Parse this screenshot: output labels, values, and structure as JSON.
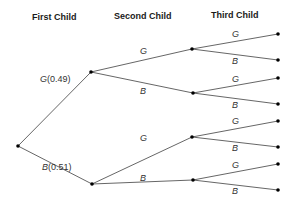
{
  "headers": [
    "First Child",
    "Second Child",
    "Third Child"
  ],
  "root": {
    "x": 18,
    "y": 146
  },
  "level1": [
    {
      "label": "G",
      "prob": "(0.49)",
      "x": 91,
      "y": 72,
      "lx": 40,
      "ly": 82
    },
    {
      "label": "B",
      "prob": "(0.51)",
      "x": 92,
      "y": 184,
      "lx": 42,
      "ly": 170
    }
  ],
  "level2": [
    {
      "parent": 0,
      "label": "G",
      "x": 192,
      "y": 49,
      "lx": 140,
      "ly": 54
    },
    {
      "parent": 0,
      "label": "B",
      "x": 193,
      "y": 93,
      "lx": 140,
      "ly": 94
    },
    {
      "parent": 1,
      "label": "G",
      "x": 192,
      "y": 137,
      "lx": 140,
      "ly": 141
    },
    {
      "parent": 1,
      "label": "B",
      "x": 193,
      "y": 180,
      "lx": 140,
      "ly": 181
    }
  ],
  "leaves": [
    {
      "parent": 0,
      "label": "G",
      "x": 278,
      "y": 34,
      "lx": 232,
      "ly": 37
    },
    {
      "parent": 0,
      "label": "B",
      "x": 278,
      "y": 60,
      "lx": 232,
      "ly": 64
    },
    {
      "parent": 1,
      "label": "G",
      "x": 278,
      "y": 78,
      "lx": 232,
      "ly": 82
    },
    {
      "parent": 1,
      "label": "B",
      "x": 278,
      "y": 104,
      "lx": 232,
      "ly": 108
    },
    {
      "parent": 2,
      "label": "G",
      "x": 278,
      "y": 121,
      "lx": 232,
      "ly": 124
    },
    {
      "parent": 2,
      "label": "B",
      "x": 278,
      "y": 147,
      "lx": 232,
      "ly": 151
    },
    {
      "parent": 3,
      "label": "G",
      "x": 278,
      "y": 164,
      "lx": 232,
      "ly": 168
    },
    {
      "parent": 3,
      "label": "B",
      "x": 278,
      "y": 190,
      "lx": 232,
      "ly": 194
    }
  ]
}
